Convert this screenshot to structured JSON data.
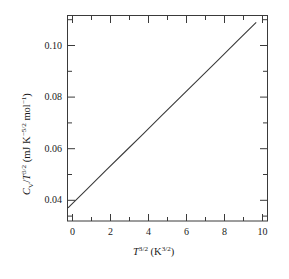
{
  "chart_data": {
    "type": "line",
    "title": "",
    "subtitle": "",
    "xlabel_plain": "T^3/2 (K^3/2)",
    "ylabel_plain": "C_V/T^3/2 (mJ K^-5/2 mol^-1)",
    "xlabel_parts": {
      "var": "T",
      "var_exp": "3/2",
      "unit_open": " (K",
      "unit_exp": "3/2",
      "unit_close": ")"
    },
    "ylabel_parts": {
      "var": "C",
      "var_sub": "V",
      "slash": "/",
      "var2": "T",
      "var2_exp": "3/2",
      "unit_open": " (mJ K",
      "unit_exp": "−5/2",
      "unit_mid": " mol",
      "unit_exp2": "−1",
      "unit_close": ")"
    },
    "xlim": [
      0,
      10.6
    ],
    "ylim": [
      0.0315,
      0.1116
    ],
    "xticks": [
      0,
      2,
      4,
      6,
      8,
      10
    ],
    "xtick_labels": [
      "0",
      "2",
      "4",
      "6",
      "8",
      "10"
    ],
    "xminor_step": 1,
    "yticks": [
      0.04,
      0.06,
      0.08,
      0.1
    ],
    "ytick_labels": [
      "0.04",
      "0.06",
      "0.08",
      "0.10"
    ],
    "yminor_step": 0.005,
    "grid": false,
    "legend": null,
    "frame": true,
    "tick_direction": "in",
    "series": [
      {
        "name": "Cv/T^3/2 vs T^3/2",
        "style": "solid-line",
        "color": "#3a3a3a",
        "intercept": 0.0366,
        "slope": 0.00723,
        "x": [
          0,
          1,
          2,
          3,
          4,
          5,
          6,
          7,
          8,
          9,
          10
        ],
        "values": [
          0.0366,
          0.0438,
          0.0511,
          0.0583,
          0.0655,
          0.0728,
          0.08,
          0.0872,
          0.0944,
          0.1017,
          0.1089
        ]
      }
    ],
    "annotations": []
  },
  "figure": {
    "background_color": "#ffffff",
    "axis_color": "#3a3a3a",
    "text_color": "#1a1a1a"
  }
}
